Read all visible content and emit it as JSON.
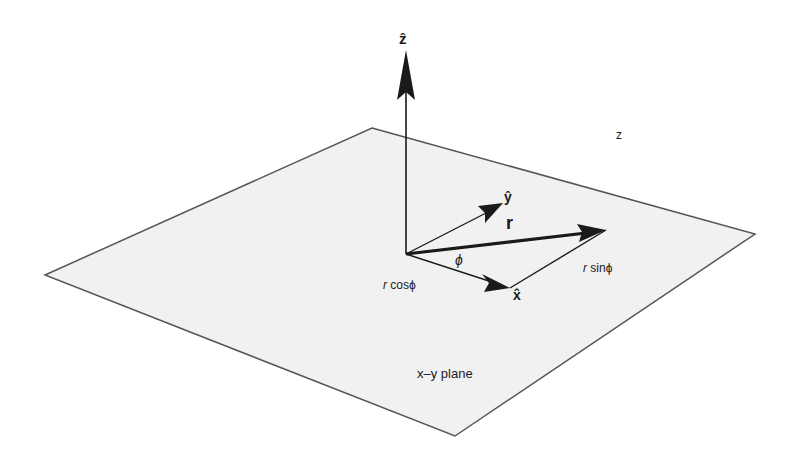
{
  "diagram": {
    "plane": {
      "label": "x–y plane",
      "fill": "#f1f1f1",
      "stroke": "#555555"
    },
    "axes": {
      "z_hat": "ẑ",
      "y_hat": "ŷ",
      "x_hat": "x̂"
    },
    "vector": {
      "label": "r"
    },
    "angle": {
      "label": "ϕ"
    },
    "components": {
      "r_prefix_cos": "r",
      "cos_label": " cosϕ",
      "r_prefix_sin": "r",
      "sin_label": " sinϕ"
    },
    "stray_label": "z",
    "ink_color": "#1a1a1a"
  }
}
